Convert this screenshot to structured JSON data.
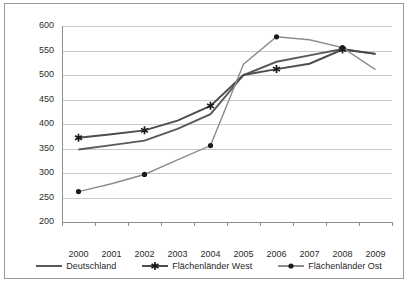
{
  "chart_data": {
    "type": "line",
    "title": "",
    "xlabel": "",
    "ylabel": "",
    "x": [
      "2000",
      "2001",
      "2002",
      "2003",
      "2004",
      "2005",
      "2006",
      "2007",
      "2008",
      "2009"
    ],
    "ylim": [
      200,
      600
    ],
    "ytick_step": 50,
    "yticks": [
      "600",
      "550",
      "500",
      "450",
      "400",
      "350",
      "300",
      "250",
      "200"
    ],
    "grid": true,
    "legend_position": "bottom-center",
    "series": [
      {
        "name": "Deutschland",
        "color": "#595959",
        "marker": "none",
        "values": [
          348,
          357,
          366,
          390,
          420,
          500,
          527,
          540,
          553,
          543
        ]
      },
      {
        "name": "Flächenländer West",
        "color": "#4d4d4d",
        "marker": "star",
        "values": [
          372,
          379,
          387,
          407,
          437,
          500,
          512,
          523,
          552,
          543
        ]
      },
      {
        "name": "Flächenländer Ost",
        "color": "#8c8c8c",
        "marker": "circle",
        "values": [
          262,
          278,
          297,
          327,
          356,
          522,
          578,
          572,
          556,
          511
        ]
      }
    ]
  },
  "legend": {
    "items": [
      {
        "label": "Deutschland",
        "marker": "none"
      },
      {
        "label": "Flächenländer West",
        "marker": "star"
      },
      {
        "label": "Flächenländer Ost",
        "marker": "circle"
      }
    ]
  }
}
